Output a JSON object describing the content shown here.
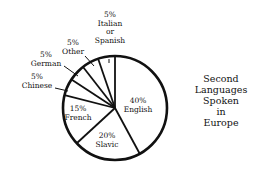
{
  "chart_data": {
    "type": "pie",
    "title": "Second Languages Spoken in Europe",
    "title_lines": [
      "Second",
      "Languages",
      "Spoken",
      "in",
      "Europe"
    ],
    "categories": [
      "English",
      "Slavic",
      "French",
      "Chinese",
      "German",
      "Other",
      "Italian or Spanish"
    ],
    "values": [
      40,
      20,
      15,
      5,
      5,
      5,
      5
    ],
    "unit": "%",
    "start_angle_deg": 0,
    "direction": "clockwise from top",
    "labels": [
      {
        "pct": "40%",
        "name": [
          "English"
        ],
        "placement": "inside"
      },
      {
        "pct": "20%",
        "name": [
          "Slavic"
        ],
        "placement": "inside"
      },
      {
        "pct": "15%",
        "name": [
          "French"
        ],
        "placement": "inside"
      },
      {
        "pct": "5%",
        "name": [
          "Chinese"
        ],
        "placement": "outside"
      },
      {
        "pct": "5%",
        "name": [
          "German"
        ],
        "placement": "outside"
      },
      {
        "pct": "5%",
        "name": [
          "Other"
        ],
        "placement": "outside"
      },
      {
        "pct": "5%",
        "name": [
          "Italian",
          "or",
          "Spanish"
        ],
        "placement": "outside"
      }
    ],
    "colors": {
      "fill": "#ffffff",
      "stroke": "#111111"
    },
    "legend": "none"
  }
}
